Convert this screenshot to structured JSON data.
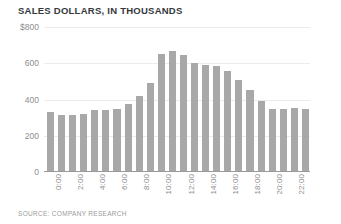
{
  "chart": {
    "title": "SALES DOLLARS, IN THOUSANDS",
    "source": "SOURCE: COMPANY RESEARCH"
  },
  "chart_data": {
    "type": "bar",
    "title": "SALES DOLLARS, IN THOUSANDS",
    "subtitle": "",
    "xlabel": "",
    "ylabel": "",
    "ylim": [
      0,
      800
    ],
    "yticks": [
      0,
      200,
      400,
      600,
      800
    ],
    "ytick_labels": [
      "0",
      "200",
      "400",
      "600",
      "$800"
    ],
    "grid": true,
    "legend": false,
    "bar_color": "#a8a8a8",
    "grid_color": "#ebebeb",
    "axis_color": "#9a9a9a",
    "text_color": "#8e8e8e",
    "title_color": "#33383d",
    "categories": [
      "0:00",
      "1:00",
      "2:00",
      "3:00",
      "4:00",
      "5:00",
      "6:00",
      "7:00",
      "8:00",
      "9:00",
      "10:00",
      "11:00",
      "12:00",
      "13:00",
      "14:00",
      "15:00",
      "16:00",
      "17:00",
      "18:00",
      "19:00",
      "20:00",
      "21:00",
      "22:00",
      "23:00"
    ],
    "xtick_labels_shown": [
      "0:00",
      "2:00",
      "4:00",
      "6:00",
      "8:00",
      "10:00",
      "12:00",
      "14:00",
      "16:00",
      "18:00",
      "20:00",
      "22:00"
    ],
    "values": [
      330,
      315,
      315,
      320,
      340,
      340,
      350,
      375,
      420,
      490,
      650,
      670,
      645,
      600,
      590,
      585,
      560,
      510,
      450,
      390,
      350,
      350,
      355,
      345
    ],
    "annotations": [],
    "source": "SOURCE: COMPANY RESEARCH"
  }
}
